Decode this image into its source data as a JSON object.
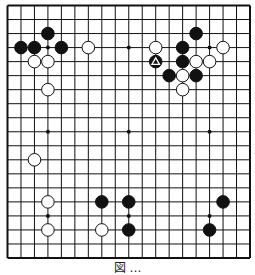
{
  "diagram": {
    "type": "go-board",
    "size": 19,
    "star_points": [
      [
        3,
        3
      ],
      [
        9,
        3
      ],
      [
        15,
        3
      ],
      [
        3,
        9
      ],
      [
        9,
        9
      ],
      [
        15,
        9
      ],
      [
        3,
        15
      ],
      [
        9,
        15
      ],
      [
        15,
        15
      ]
    ],
    "stones": [
      {
        "color": "black",
        "col": 3,
        "row": 2
      },
      {
        "color": "black",
        "col": 1,
        "row": 3
      },
      {
        "color": "black",
        "col": 2,
        "row": 3
      },
      {
        "color": "black",
        "col": 4,
        "row": 3
      },
      {
        "color": "white",
        "col": 6,
        "row": 3
      },
      {
        "color": "white",
        "col": 2,
        "row": 4
      },
      {
        "color": "white",
        "col": 3,
        "row": 4
      },
      {
        "color": "white",
        "col": 3,
        "row": 6
      },
      {
        "color": "black",
        "col": 14,
        "row": 2
      },
      {
        "color": "white",
        "col": 11,
        "row": 3
      },
      {
        "color": "black",
        "col": 13,
        "row": 3
      },
      {
        "color": "white",
        "col": 16,
        "row": 3
      },
      {
        "color": "black",
        "col": 11,
        "row": 4,
        "marker": "triangle"
      },
      {
        "color": "black",
        "col": 13,
        "row": 4
      },
      {
        "color": "white",
        "col": 14,
        "row": 4
      },
      {
        "color": "white",
        "col": 15,
        "row": 4
      },
      {
        "color": "black",
        "col": 12,
        "row": 5
      },
      {
        "color": "white",
        "col": 13,
        "row": 5
      },
      {
        "color": "black",
        "col": 14,
        "row": 5
      },
      {
        "color": "white",
        "col": 13,
        "row": 6
      },
      {
        "color": "white",
        "col": 2,
        "row": 11
      },
      {
        "color": "white",
        "col": 3,
        "row": 14
      },
      {
        "color": "white",
        "col": 3,
        "row": 16
      },
      {
        "color": "black",
        "col": 7,
        "row": 14
      },
      {
        "color": "black",
        "col": 9,
        "row": 14
      },
      {
        "color": "white",
        "col": 7,
        "row": 16
      },
      {
        "color": "black",
        "col": 9,
        "row": 16
      },
      {
        "color": "black",
        "col": 16,
        "row": 14
      },
      {
        "color": "black",
        "col": 15,
        "row": 16
      }
    ],
    "caption": "図 …",
    "colors": {
      "line": "#111111",
      "black_stone": "#111111",
      "white_stone": "#ffffff",
      "background": "#ffffff"
    }
  }
}
